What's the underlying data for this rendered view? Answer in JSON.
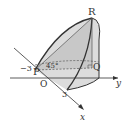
{
  "figure": {
    "type": "3d-solid-diagram",
    "labels": {
      "R": "R",
      "P": "P",
      "O": "O",
      "Q": "Q",
      "x_axis": "x",
      "y_axis": "y",
      "minus_three": "−3",
      "three": "3",
      "angle": "45°"
    },
    "colors": {
      "fill": "#d8d8d8",
      "fill_dark": "#c4c4c4",
      "line": "#333333"
    }
  }
}
